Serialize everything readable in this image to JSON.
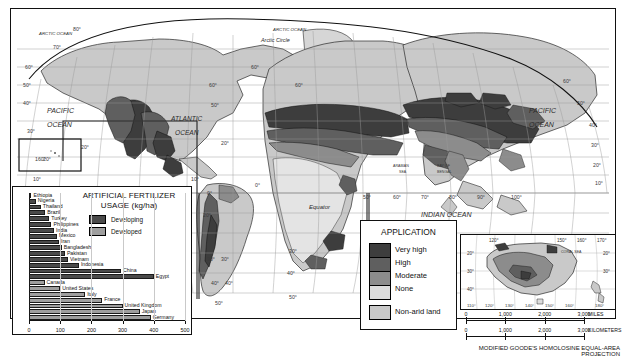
{
  "map": {
    "title_projection": "MODIFIED GOODE'S HOMOLOSINE EQUAL-AREA PROJECTION",
    "ocean_labels": [
      {
        "name": "PACIFIC",
        "sub": "OCEAN",
        "x": 38,
        "y": 104
      },
      {
        "name": "ATLANTIC",
        "sub": "OCEAN",
        "x": 168,
        "y": 115
      },
      {
        "name": "PACIFIC",
        "sub": "OCEAN",
        "x": 534,
        "y": 105
      },
      {
        "name": "INDIAN",
        "sub": "OCEAN",
        "x": 432,
        "y": 211
      }
    ],
    "polar_labels": [
      {
        "name": "ARCTIC OCEAN",
        "x": 58,
        "y": 30
      },
      {
        "name": "ARCTIC OCEAN",
        "x": 297,
        "y": 27
      },
      {
        "name": "Arctic Circle",
        "x": 283,
        "y": 37
      }
    ],
    "sea_labels": [
      {
        "name": "ARABIAN",
        "sub": "SEA",
        "x": 397,
        "y": 163
      },
      {
        "name": "BAY OF",
        "sub": "BENGAL",
        "x": 443,
        "y": 163
      },
      {
        "name": "CORAL  SEA",
        "x": 552,
        "y": 245
      }
    ],
    "equator_label": "Equator",
    "latitude_ticks": [
      "80°",
      "70°",
      "60°",
      "50°",
      "40°",
      "30°",
      "20°",
      "10°",
      "0°",
      "10°",
      "20°",
      "30°",
      "40°",
      "50°"
    ],
    "longitude_ticks": [
      "160°",
      "0°",
      "20°",
      "50°",
      "60°",
      "70°",
      "80°",
      "90°",
      "100°",
      "120°",
      "140°",
      "150°",
      "160°",
      "170°",
      "180°",
      "110°",
      "130°"
    ]
  },
  "application_legend": {
    "title": "APPLICATION",
    "items": [
      {
        "label": "Very high",
        "color": "#3d3d3d"
      },
      {
        "label": "High",
        "color": "#5f5f5f"
      },
      {
        "label": "Moderate",
        "color": "#8c8c8c"
      },
      {
        "label": "None",
        "color": "#dcdcdc"
      }
    ],
    "extra": {
      "label": "Non-arid land",
      "color": "#c9c9c9"
    }
  },
  "chart_data": {
    "type": "bar",
    "title": "ARTIFICIAL FERTILIZER USAGE (kg/ha)",
    "title_line1": "ARTIFICIAL FERTILIZER",
    "title_line2": "USAGE (kg/ha)",
    "xlabel": "",
    "ylabel": "",
    "xlim": [
      0,
      500
    ],
    "xticks": [
      0,
      100,
      200,
      300,
      400,
      500
    ],
    "xtick_labels": [
      "0",
      "100",
      "200",
      "300",
      "400",
      "500"
    ],
    "grid": true,
    "legend_position": "top-right",
    "legend": [
      {
        "name": "Developing",
        "color": "#4a4a4a"
      },
      {
        "name": "Developed",
        "color": "#9e9e9e"
      }
    ],
    "series": [
      {
        "name": "Developing",
        "color": "#4a4a4a",
        "categories": [
          "Ethiopia",
          "Nigeria",
          "Thailand",
          "Brazil",
          "Turkey",
          "Philippines",
          "India",
          "Mexico",
          "Iran",
          "Bangladesh",
          "Pakistan",
          "Vietnam",
          "Indonesia",
          "China",
          "Egypt"
        ],
        "values": [
          8,
          22,
          38,
          52,
          65,
          72,
          80,
          90,
          96,
          105,
          115,
          125,
          160,
          295,
          400
        ]
      },
      {
        "name": "Developed",
        "color": "#9e9e9e",
        "categories": [
          "Canada",
          "United States",
          "Italy",
          "France",
          "United Kingdom",
          "Japan",
          "Germany"
        ],
        "values": [
          50,
          100,
          180,
          235,
          300,
          355,
          390
        ]
      }
    ]
  },
  "australia_inset": {
    "longitude_ticks": [
      "110°",
      "120°",
      "130°",
      "140°",
      "150°",
      "160°",
      "170°",
      "180°"
    ],
    "latitude_ticks": [
      "20°",
      "30°",
      "40°"
    ],
    "sea_label": "CORAL  SEA"
  },
  "scales": {
    "miles": {
      "values": [
        "0",
        "1,000",
        "2,000",
        "3,000"
      ],
      "unit": "MILES"
    },
    "kilometers": {
      "values": [
        "0",
        "1,000",
        "2,000",
        "3,000"
      ],
      "unit": "KILOMETERS"
    }
  }
}
